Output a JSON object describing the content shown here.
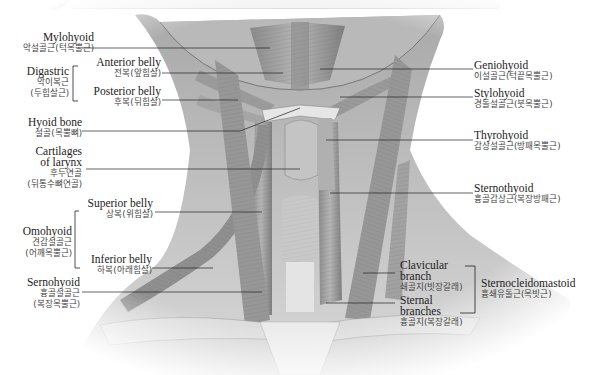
{
  "labels_left": [
    {
      "id": "mylohyoid",
      "en": "Mylohyoid",
      "ko": "악설골근(턱목뿔근)"
    },
    {
      "id": "digastric",
      "en": "Digastric",
      "ko": "악이복근",
      "ko2": "(두힘살근)"
    },
    {
      "id": "anterior-belly",
      "en": "Anterior belly",
      "ko": "전복(앞힘살)"
    },
    {
      "id": "posterior-belly",
      "en": "Posterior belly",
      "ko": "후복(뒤힘살)"
    },
    {
      "id": "hyoid-bone",
      "en": "Hyoid bone",
      "ko": "설골(목뿔뼈)"
    },
    {
      "id": "cartilages-larynx",
      "en": "Cartilages",
      "en2": "of larynx",
      "ko": "후두연골",
      "ko2": "(뒤통수뼈연골)"
    },
    {
      "id": "superior-belly",
      "en": "Superior belly",
      "ko": "상복(위힘살)"
    },
    {
      "id": "omohyoid",
      "en": "Omohyoid",
      "ko": "견갑설골근",
      "ko2": "(어깨목뿔근)"
    },
    {
      "id": "inferior-belly",
      "en": "Inferior belly",
      "ko": "하복(아래힘살)"
    },
    {
      "id": "sternohyoid",
      "en": "Sernohyoid",
      "ko": "흉골설골근",
      "ko2": "(복장목뿔근)"
    }
  ],
  "labels_right": [
    {
      "id": "geniohyoid",
      "en": "Geniohyoid",
      "ko": "이설골근(턱끝목뿔근)"
    },
    {
      "id": "stylohyoid",
      "en": "Stylohyoid",
      "ko": "경돌설골근(붓목뿔근)"
    },
    {
      "id": "thyrohyoid",
      "en": "Thyrohyoid",
      "ko": "갑상설골근(방패목뿔근)"
    },
    {
      "id": "sternothyroid",
      "en": "Sternothyoid",
      "ko": "흉골갑상근(복장방패근)"
    },
    {
      "id": "clavicular-branch",
      "en": "Clavicular",
      "en2": "branch",
      "ko": "쇄골지(빗장갈래)"
    },
    {
      "id": "sternal-branches",
      "en": "Sternal",
      "en2": "branches",
      "ko": "흉골지(복장갈래)"
    },
    {
      "id": "sternocleidomastoid",
      "en": "Sternocleidomastoid",
      "ko": "흉쇄유돌근(목빗근)"
    }
  ]
}
